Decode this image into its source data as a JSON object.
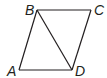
{
  "figure": {
    "type": "parallelogram with diagonal",
    "stroke_color": "#231f20",
    "vertices": {
      "A": {
        "label": "A",
        "x": 19,
        "y": 70
      },
      "B": {
        "label": "B",
        "x": 37,
        "y": 10
      },
      "C": {
        "label": "C",
        "x": 91,
        "y": 10
      },
      "D": {
        "label": "D",
        "x": 72,
        "y": 70
      }
    },
    "segments": [
      "AB",
      "BC",
      "CD",
      "DA",
      "BD"
    ]
  }
}
